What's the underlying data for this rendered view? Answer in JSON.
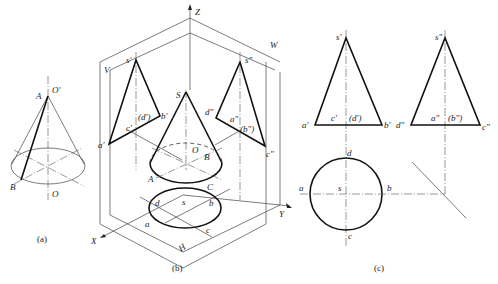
{
  "figure": {
    "panels": [
      {
        "id": "a",
        "caption": "(a)",
        "labels": {
          "apex": "A",
          "apex_axis": "O'",
          "base_point": "B",
          "base_center": "O"
        }
      },
      {
        "id": "b",
        "caption": "(b)",
        "axes": {
          "z": "Z",
          "x": "X",
          "y": "Y"
        },
        "planes": {
          "v": "V",
          "w": "W",
          "h": "H"
        },
        "front_view": {
          "s": "s'",
          "a": "a'",
          "b": "b'",
          "c": "c'",
          "d": "(d')"
        },
        "side_view": {
          "s": "s\"",
          "a": "a\"",
          "b": "(b\")",
          "c": "c\"",
          "d": "d\""
        },
        "solid": {
          "apex": "S",
          "center": "O",
          "a": "A",
          "b": "B",
          "c": "C"
        },
        "top_view": {
          "s": "s",
          "a": "a",
          "b": "b",
          "c": "c",
          "d": "d"
        }
      },
      {
        "id": "c",
        "caption": "(c)",
        "front_view": {
          "s": "s'",
          "a": "a'",
          "c": "c'",
          "d": "(d')",
          "b": "b'"
        },
        "side_view": {
          "s": "s\"",
          "d": "d\"",
          "a": "a\"",
          "b": "(b\")",
          "c": "c\""
        },
        "top_view": {
          "d": "d",
          "a": "a",
          "s": "s",
          "b": "b",
          "c": "c"
        }
      }
    ]
  }
}
